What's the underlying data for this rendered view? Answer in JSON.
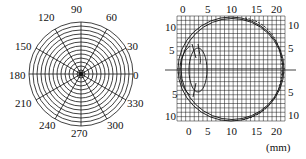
{
  "polar_chart": {
    "angle_labels": [
      {
        "text": "90",
        "x": 71,
        "y": 4
      },
      {
        "text": "60",
        "x": 106,
        "y": 12
      },
      {
        "text": "120",
        "x": 38,
        "y": 12
      },
      {
        "text": "30",
        "x": 127,
        "y": 41
      },
      {
        "text": "150",
        "x": 15,
        "y": 41
      },
      {
        "text": "0",
        "x": 133,
        "y": 70
      },
      {
        "text": "180",
        "x": 9,
        "y": 70
      },
      {
        "text": "330",
        "x": 127,
        "y": 98
      },
      {
        "text": "210",
        "x": 15,
        "y": 98
      },
      {
        "text": "300",
        "x": 107,
        "y": 120
      },
      {
        "text": "240",
        "x": 39,
        "y": 120
      },
      {
        "text": "270",
        "x": 71,
        "y": 128
      }
    ],
    "rings": 13,
    "spoke_interval_deg": 30
  },
  "grid_chart": {
    "top_ticks": [
      "0",
      "5",
      "10",
      "15",
      "20"
    ],
    "bottom_ticks": [
      "0",
      "5",
      "10",
      "15",
      "20"
    ],
    "left_ticks": [
      "10",
      "5",
      "5",
      "10"
    ],
    "right_ticks": [
      "10",
      "5",
      "5",
      "10"
    ],
    "unit_label": "(mm)"
  },
  "chart_data": [
    {
      "type": "polar-grid",
      "title": "",
      "angle_ticks_deg": [
        0,
        30,
        60,
        90,
        120,
        150,
        180,
        210,
        240,
        270,
        300,
        330
      ],
      "concentric_rings": 13
    },
    {
      "type": "diagram-grid",
      "title": "",
      "x_ticks": [
        0,
        5,
        10,
        15,
        20
      ],
      "y_ticks_top": [
        10,
        5
      ],
      "y_ticks_bottom": [
        5,
        10
      ],
      "x_unit": "mm",
      "description": "Eyeball cross-section outline overlaid on a millimeter grid, with lens shape on left and horizontal axis line through center"
    }
  ]
}
